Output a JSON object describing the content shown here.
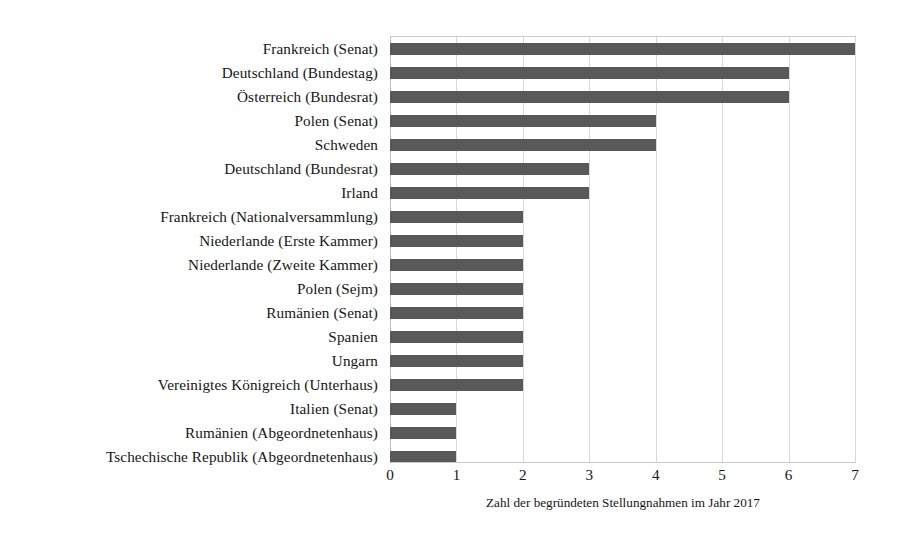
{
  "chart_data": {
    "type": "bar",
    "orientation": "horizontal",
    "title": "",
    "xlabel": "Zahl der begründeten Stellungnahmen im Jahr 2017",
    "ylabel": "",
    "xlim": [
      0,
      7
    ],
    "xticks": [
      "0",
      "1",
      "2",
      "3",
      "4",
      "5",
      "6",
      "7"
    ],
    "grid": true,
    "legend": "none",
    "bar_color": "#595959",
    "categories": [
      "Frankreich (Senat)",
      "Deutschland (Bundestag)",
      "Österreich (Bundesrat)",
      "Polen (Senat)",
      "Schweden",
      "Deutschland (Bundesrat)",
      "Irland",
      "Frankreich (Nationalversammlung)",
      "Niederlande (Erste Kammer)",
      "Niederlande (Zweite Kammer)",
      "Polen (Sejm)",
      "Rumänien (Senat)",
      "Spanien",
      "Ungarn",
      "Vereinigtes Königreich (Unterhaus)",
      "Italien (Senat)",
      "Rumänien (Abgeordnetenhaus)",
      "Tschechische Republik (Abgeordnetenhaus)"
    ],
    "values": [
      7,
      6,
      6,
      4,
      4,
      3,
      3,
      2,
      2,
      2,
      2,
      2,
      2,
      2,
      2,
      1,
      1,
      1
    ]
  }
}
